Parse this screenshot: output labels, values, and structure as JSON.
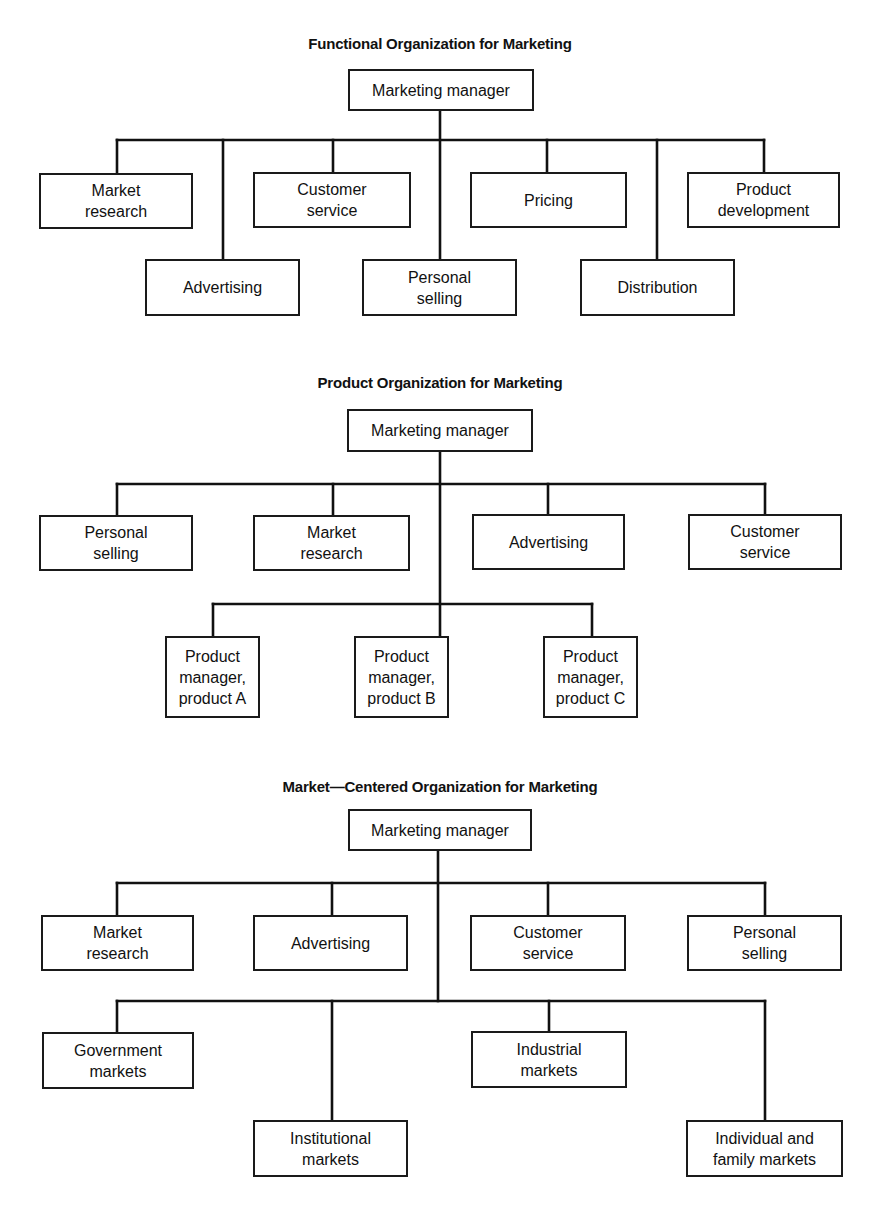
{
  "charts": [
    {
      "title": "Functional Organization for Marketing",
      "head": "Marketing manager",
      "units": [
        "Market\nresearch",
        "Advertising",
        "Customer\nservice",
        "Personal\nselling",
        "Pricing",
        "Distribution",
        "Product\ndevelopment"
      ]
    },
    {
      "title": "Product Organization for Marketing",
      "head": "Marketing manager",
      "staff": [
        "Personal\nselling",
        "Market\nresearch",
        "Advertising",
        "Customer\nservice"
      ],
      "line": [
        "Product\nmanager,\nproduct A",
        "Product\nmanager,\nproduct B",
        "Product\nmanager,\nproduct C"
      ]
    },
    {
      "title": "Market—Centered Organization for Marketing",
      "head": "Marketing manager",
      "staff": [
        "Market\nresearch",
        "Advertising",
        "Customer\nservice",
        "Personal\nselling"
      ],
      "line": [
        "Government\nmarkets",
        "Institutional\nmarkets",
        "Industrial\nmarkets",
        "Individual and\nfamily markets"
      ]
    }
  ]
}
